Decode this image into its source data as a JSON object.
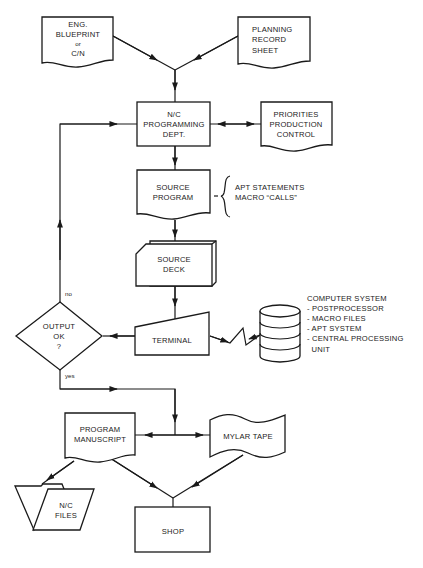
{
  "diagram": {
    "colors": {
      "stroke": "#1a1a1a",
      "background": "#ffffff"
    },
    "nodes": {
      "eng_blueprint": {
        "shape": "document",
        "lines": [
          "ENG.",
          "BLUEPRINT",
          "or",
          "C/N"
        ]
      },
      "planning_record": {
        "shape": "document",
        "lines": [
          "PLANNING",
          "RECORD",
          "SHEET"
        ]
      },
      "nc_programming": {
        "shape": "process",
        "lines": [
          "N/C",
          "PROGRAMMING",
          "DEPT."
        ]
      },
      "priorities": {
        "shape": "document",
        "lines": [
          "PRIORITIES",
          "PRODUCTION",
          "CONTROL"
        ]
      },
      "source_program": {
        "shape": "document",
        "lines": [
          "SOURCE",
          "PROGRAM"
        ]
      },
      "source_program_note": {
        "shape": "annotation",
        "lines": [
          "APT STATEMENTS",
          "MACRO “CALLS”"
        ]
      },
      "source_deck": {
        "shape": "punched-card-deck",
        "lines": [
          "SOURCE",
          "DECK"
        ]
      },
      "terminal": {
        "shape": "manual-input",
        "lines": [
          "TERMINAL"
        ]
      },
      "computer_system": {
        "shape": "magnetic-disk",
        "lines": []
      },
      "computer_system_note": {
        "shape": "annotation",
        "lines": [
          "COMPUTER SYSTEM",
          "- POSTPROCESSOR",
          "- MACRO FILES",
          "- APT SYSTEM",
          "- CENTRAL PROCESSING",
          "  UNIT"
        ]
      },
      "output_ok": {
        "shape": "decision",
        "lines": [
          "OUTPUT",
          "OK",
          "?"
        ]
      },
      "program_manuscript": {
        "shape": "document",
        "lines": [
          "PROGRAM",
          "MANUSCRIPT"
        ]
      },
      "mylar_tape": {
        "shape": "punched-tape",
        "lines": [
          "MYLAR TAPE"
        ]
      },
      "nc_files": {
        "shape": "file-folder",
        "lines": [
          "N/C",
          "FILES"
        ]
      },
      "shop": {
        "shape": "process",
        "lines": [
          "SHOP"
        ]
      }
    },
    "edge_labels": {
      "no": "no",
      "yes": "yes"
    }
  }
}
